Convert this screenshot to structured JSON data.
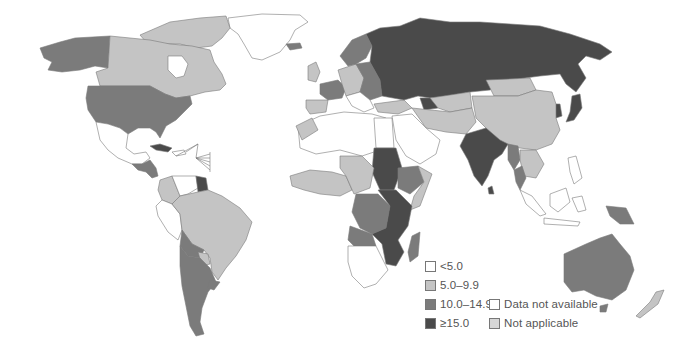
{
  "map": {
    "type": "choropleth",
    "projection": "world",
    "palette": {
      "lt5": "#ffffff",
      "5to9_9": "#c4c4c4",
      "10to14_9": "#7b7b7b",
      "ge15": "#4a4a4a",
      "data_not_available": "#ffffff",
      "not_applicable": "#d6d6d6",
      "border": "#7a7a7a"
    }
  },
  "legend": {
    "items": [
      {
        "label": "<5.0",
        "color": "#ffffff"
      },
      {
        "label": "5.0–9.9",
        "color": "#c4c4c4"
      },
      {
        "label": "10.0–14.9",
        "color": "#7b7b7b"
      },
      {
        "label": "≥15.0",
        "color": "#4a4a4a"
      },
      {
        "label": "Data not available",
        "color": "#ffffff"
      },
      {
        "label": "Not applicable",
        "color": "#d6d6d6"
      }
    ]
  }
}
